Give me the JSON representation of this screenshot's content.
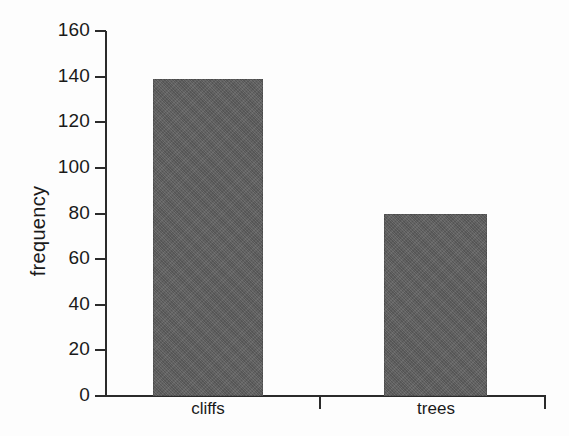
{
  "chart_data": {
    "type": "bar",
    "title": "",
    "subtitle": "",
    "xlabel": "",
    "ylabel": "frequency",
    "categories": [
      "cliffs",
      "trees"
    ],
    "values": [
      139,
      80
    ],
    "series": [
      {
        "name": "frequency",
        "values": [
          139,
          80
        ]
      }
    ],
    "ylim": [
      0,
      160
    ],
    "yticks": [
      0,
      20,
      40,
      60,
      80,
      100,
      120,
      140,
      160
    ],
    "ytick_labels": [
      "0",
      "20",
      "40",
      "60",
      "80",
      "100",
      "120",
      "140",
      "160"
    ],
    "grid": false,
    "legend": false,
    "legend_position": "none",
    "bar_color": "#5e5e5e",
    "axis_color": "#2b2b2b",
    "background_color": "#fdfdfd",
    "annotations": []
  },
  "axis": {
    "y_title": "frequency",
    "ticks": [
      {
        "value": 160,
        "label": "160"
      },
      {
        "value": 140,
        "label": "140"
      },
      {
        "value": 120,
        "label": "120"
      },
      {
        "value": 100,
        "label": "100"
      },
      {
        "value": 80,
        "label": "80"
      },
      {
        "value": 60,
        "label": "60"
      },
      {
        "value": 40,
        "label": "40"
      },
      {
        "value": 20,
        "label": "20"
      },
      {
        "value": 0,
        "label": "0"
      }
    ],
    "category_labels": [
      "cliffs",
      "trees"
    ]
  }
}
